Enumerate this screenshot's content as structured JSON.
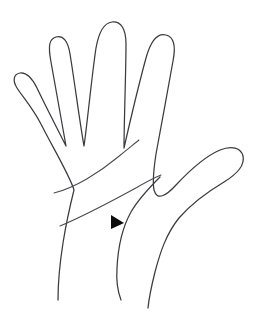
{
  "figure": {
    "type": "line-drawing",
    "caption": "",
    "background_color": "#ffffff",
    "outline_color": "#3b3b40",
    "crease_color": "#4a4a50",
    "marker_color": "#0c0c0c",
    "canvas": {
      "width": 255,
      "height": 314
    }
  },
  "hand": {
    "orientation": "palm facing viewer",
    "digits": [
      {
        "name": "pinky-finger",
        "label": "Little finger",
        "tip_x": 24,
        "tip_y": 83
      },
      {
        "name": "index-finger",
        "label": "Index finger",
        "tip_x": 62,
        "tip_y": 33
      },
      {
        "name": "middle-finger",
        "label": "Middle finger",
        "tip_x": 124,
        "tip_y": 19
      },
      {
        "name": "ring-finger",
        "label": "Ring finger",
        "tip_x": 168,
        "tip_y": 33
      },
      {
        "name": "thumb",
        "label": "Thumb",
        "tip_x": 237,
        "tip_y": 154
      }
    ],
    "palm_creases": [
      {
        "name": "upper-crease",
        "label": "Heart line",
        "from_x": 54,
        "from_y": 193,
        "to_x": 138,
        "to_y": 141
      },
      {
        "name": "lower-crease",
        "label": "Head line",
        "from_x": 60,
        "from_y": 225,
        "to_x": 160,
        "to_y": 175
      }
    ],
    "wrist": {
      "left_x": 57,
      "right_x": 148,
      "y": 300
    }
  },
  "marker": {
    "name": "pointer-triangle",
    "shape": "right-pointing-triangle",
    "label": "Pointer",
    "x": 111,
    "y": 215,
    "width": 13,
    "height": 14,
    "color": "#0c0c0c"
  }
}
